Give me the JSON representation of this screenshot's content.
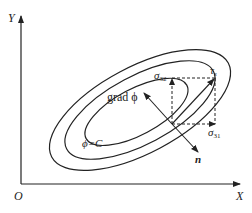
{
  "diagram": {
    "axes": {
      "y_label": "Y",
      "x_label": "X",
      "origin_label": "O"
    },
    "contours": {
      "count": 3,
      "label": "ϕ=C"
    },
    "vectors": {
      "gradient_label": "grad ϕ",
      "normal_label": "n",
      "shear_label": "τ",
      "shear_subscript": "s",
      "sigma32_label": "σ",
      "sigma32_subscript": "32",
      "sigma31_label": "σ",
      "sigma31_subscript": "31"
    },
    "colors": {
      "stroke": "#222222",
      "background": "#ffffff"
    }
  }
}
